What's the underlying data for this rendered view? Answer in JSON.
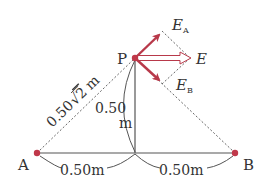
{
  "diagram": {
    "points": {
      "A": {
        "label": "A",
        "x": 37,
        "y": 153
      },
      "B": {
        "label": "B",
        "x": 235,
        "y": 153
      },
      "P": {
        "label": "P",
        "x": 135,
        "y": 58
      },
      "O": {
        "x": 135,
        "y": 153
      }
    },
    "dimensions": {
      "AP": "0.50√2 m",
      "AP_main": "0.50",
      "AP_root": "2",
      "AP_unit": "m",
      "PO_value": "0.50",
      "PO_unit": "m",
      "AO": "0.50m",
      "OB": "0.50m"
    },
    "vectors": {
      "EA": {
        "symbol": "E",
        "subscript": "A"
      },
      "EB": {
        "symbol": "E",
        "subscript": "B"
      },
      "E": {
        "symbol": "E"
      }
    },
    "colors": {
      "charge": "#c0384a",
      "vector": "#b8394a",
      "resultant_fill": "#ffffff",
      "line": "#555555",
      "dotted": "#666666",
      "text": "#333333"
    }
  }
}
